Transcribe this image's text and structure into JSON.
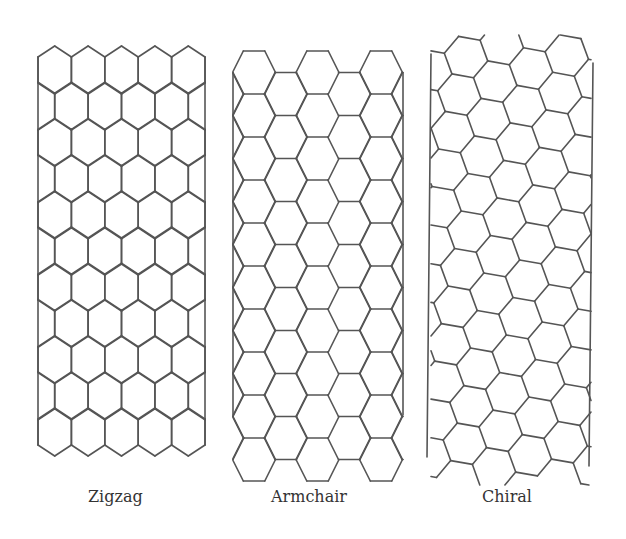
{
  "figure": {
    "width": 626,
    "height": 539,
    "background": "#ffffff",
    "stroke_color": "#555555",
    "stroke_width": 1.6
  },
  "tubes": [
    {
      "id": "zigzag",
      "label": "Zigzag",
      "label_x": 88,
      "type": "zigzag",
      "left_x": 38,
      "right_x": 205,
      "top_y": 46,
      "columns": 5,
      "rows": 11,
      "cap_rise": 11,
      "side_len": 26,
      "row_pitch": 36.2
    },
    {
      "id": "armchair",
      "label": "Armchair",
      "label_x": 271,
      "type": "armchair",
      "left_x": 233,
      "right_x": 403,
      "top_y": 51,
      "hex_side": 21.5,
      "half_height": 21.5,
      "column_pitch": 63.5,
      "first_center_x": 254,
      "rows": 19,
      "line_top_y": 73,
      "line_bottom_y": 415
    },
    {
      "id": "chiral",
      "label": "Chiral",
      "label_x": 482,
      "type": "chiral",
      "left_line": [
        [
          431,
          54
        ],
        [
          427,
          457
        ]
      ],
      "right_line": [
        [
          593,
          63
        ],
        [
          589,
          466
        ]
      ],
      "origin": [
        455,
        38
      ],
      "hex_side": 22,
      "rotation_deg": 10,
      "clip_left": 431,
      "clip_right": 591,
      "clip_top": 35,
      "clip_bottom": 485
    }
  ]
}
